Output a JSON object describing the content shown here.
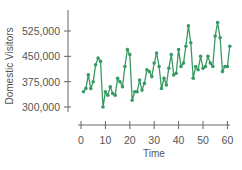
{
  "chart_data": {
    "type": "line",
    "title": "",
    "xlabel": "Time",
    "ylabel": "Domestic Visitors",
    "xlim": [
      0,
      61
    ],
    "ylim": [
      290000,
      560000
    ],
    "x_ticks": [
      0,
      10,
      20,
      30,
      40,
      50,
      60
    ],
    "x_tick_labels": [
      "0",
      "10",
      "20",
      "30",
      "40",
      "50",
      "60"
    ],
    "y_ticks": [
      300000,
      375000,
      450000,
      525000
    ],
    "y_tick_labels": [
      "300,000",
      "375,000",
      "450,000",
      "525,000"
    ],
    "grid": false,
    "legend": null,
    "series": [
      {
        "name": "Domestic Visitors",
        "color": "#3a9a64",
        "marker": "circle",
        "x": [
          1,
          2,
          3,
          4,
          5,
          6,
          7,
          8,
          9,
          10,
          11,
          12,
          13,
          14,
          15,
          16,
          17,
          18,
          19,
          20,
          21,
          22,
          23,
          24,
          25,
          26,
          27,
          28,
          29,
          30,
          31,
          32,
          33,
          34,
          35,
          36,
          37,
          38,
          39,
          40,
          41,
          42,
          43,
          44,
          45,
          46,
          47,
          48,
          49,
          50,
          51,
          52,
          53,
          54,
          55,
          56,
          57,
          58,
          59,
          60,
          61
        ],
        "values": [
          345000,
          355000,
          395000,
          355000,
          375000,
          425000,
          445000,
          435000,
          300000,
          345000,
          335000,
          360000,
          340000,
          335000,
          385000,
          375000,
          360000,
          420000,
          470000,
          455000,
          320000,
          345000,
          345000,
          380000,
          350000,
          370000,
          410000,
          405000,
          390000,
          430000,
          460000,
          420000,
          355000,
          385000,
          365000,
          415000,
          455000,
          395000,
          400000,
          470000,
          420000,
          430000,
          480000,
          540000,
          490000,
          385000,
          420000,
          410000,
          450000,
          415000,
          420000,
          450000,
          430000,
          420000,
          510000,
          550000,
          505000,
          405000,
          420000,
          420000,
          480000
        ]
      }
    ]
  }
}
